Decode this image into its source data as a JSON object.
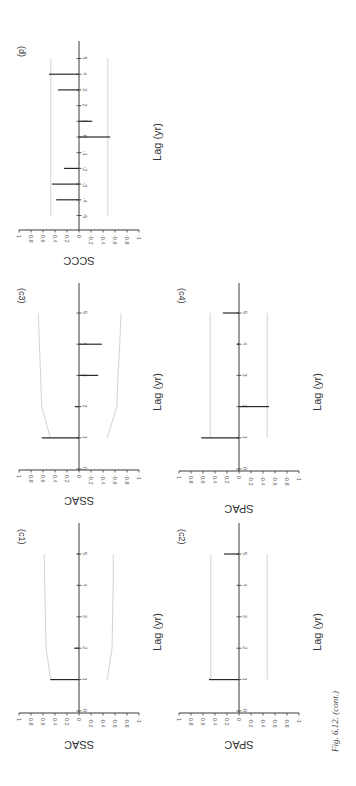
{
  "caption": "Fig. 6.12. (cont.)",
  "colors": {
    "bar": "#2a2a2a",
    "axis": "#3a3a3a",
    "confidence": "#c8c8c8"
  },
  "chart_data": [
    {
      "id": "d",
      "type": "bar",
      "panel_label": "(d)",
      "ylabel": "SCCC",
      "xlabel": "Lag (yr)",
      "categories": [
        -5,
        -4,
        -3,
        -2,
        -1,
        0,
        1,
        2,
        3,
        4,
        5
      ],
      "values": [
        0,
        0.38,
        0.45,
        0.25,
        0,
        -0.52,
        -0.22,
        0,
        0.35,
        0.5,
        0
      ],
      "confidence_upper": [
        0.47,
        0.47,
        0.47,
        0.47,
        0.47,
        0.47,
        0.47,
        0.47,
        0.47,
        0.47,
        0.47
      ],
      "confidence_lower": [
        -0.48,
        -0.48,
        -0.48,
        -0.48,
        -0.48,
        -0.48,
        -0.48,
        -0.48,
        -0.48,
        -0.48,
        -0.48
      ],
      "ylim": [
        -1,
        1
      ],
      "yticks": [
        "1",
        "0.8",
        "0.6",
        "0.4",
        "0.2",
        "0",
        "-0.2",
        "-0.4",
        "-0.6",
        "-0.8",
        "-1"
      ],
      "xticks": [
        "-5",
        "-4",
        "-3",
        "-2",
        "-1",
        "0",
        "1",
        "2",
        "3",
        "4",
        "5"
      ]
    },
    {
      "id": "c3",
      "type": "bar",
      "panel_label": "(c3)",
      "ylabel": "SSAC",
      "xlabel": "Lag (yr)",
      "categories": [
        0,
        1,
        2,
        3,
        4,
        5
      ],
      "values": [
        0,
        0.62,
        0.07,
        -0.32,
        -0.38,
        0
      ],
      "confidence_upper": [
        null,
        0.48,
        0.62,
        0.64,
        0.66,
        0.68
      ],
      "confidence_lower": [
        null,
        -0.47,
        -0.63,
        -0.65,
        -0.68,
        -0.7
      ],
      "ylim": [
        -1,
        1
      ],
      "yticks": [
        "1",
        "0.8",
        "0.6",
        "0.4",
        "0.2",
        "0",
        "-0.2",
        "-0.4",
        "-0.6",
        "-0.8",
        "-1"
      ],
      "xticks": [
        "0",
        "1",
        "2",
        "3",
        "4",
        "5"
      ]
    },
    {
      "id": "c4",
      "type": "bar",
      "panel_label": "(c4)",
      "ylabel": "SPAC",
      "xlabel": "Lag (yr)",
      "categories": [
        0,
        1,
        2,
        3,
        4,
        5
      ],
      "values": [
        0,
        0.63,
        -0.5,
        0,
        0.03,
        0.27
      ],
      "confidence_upper": [
        null,
        0.48,
        0.48,
        0.48,
        0.48,
        0.48
      ],
      "confidence_lower": [
        null,
        -0.47,
        -0.47,
        -0.47,
        -0.47,
        -0.47
      ],
      "ylim": [
        -1,
        1
      ],
      "yticks": [
        "1",
        "0.8",
        "0.6",
        "0.4",
        "0.2",
        "0",
        "-0.2",
        "-0.4",
        "-0.6",
        "-0.8",
        "-1"
      ],
      "xticks": [
        "0",
        "1",
        "2",
        "3",
        "4",
        "5"
      ]
    },
    {
      "id": "c1",
      "type": "bar",
      "panel_label": "(c1)",
      "ylabel": "SSAC",
      "xlabel": "Lag (yr)",
      "categories": [
        0,
        1,
        2,
        3,
        4,
        5
      ],
      "values": [
        0,
        0.48,
        0.08,
        0,
        0.01,
        0.03
      ],
      "confidence_upper": [
        null,
        0.47,
        0.55,
        0.56,
        0.57,
        0.58
      ],
      "confidence_lower": [
        null,
        -0.47,
        -0.55,
        -0.56,
        -0.57,
        -0.57
      ],
      "ylim": [
        -1,
        1
      ],
      "yticks": [
        "1",
        "0.8",
        "0.6",
        "0.4",
        "0.2",
        "0",
        "-0.2",
        "-0.4",
        "-0.6",
        "-0.8",
        "-1"
      ],
      "xticks": [
        "0",
        "1",
        "2",
        "3",
        "4",
        "5"
      ]
    },
    {
      "id": "c2",
      "type": "bar",
      "panel_label": "(c2)",
      "ylabel": "SPAC",
      "xlabel": "Lag (yr)",
      "categories": [
        0,
        1,
        2,
        3,
        4,
        5
      ],
      "values": [
        0,
        0.5,
        0,
        0,
        0.01,
        0.25
      ],
      "confidence_upper": [
        null,
        0.47,
        0.47,
        0.47,
        0.47,
        0.47
      ],
      "confidence_lower": [
        null,
        -0.47,
        -0.47,
        -0.47,
        -0.47,
        -0.47
      ],
      "ylim": [
        -1,
        1
      ],
      "yticks": [
        "1",
        "0.8",
        "0.6",
        "0.4",
        "0.2",
        "0",
        "-0.2",
        "-0.4",
        "-0.6",
        "-0.8",
        "-1"
      ],
      "xticks": [
        "0",
        "1",
        "2",
        "3",
        "4",
        "5"
      ]
    }
  ]
}
